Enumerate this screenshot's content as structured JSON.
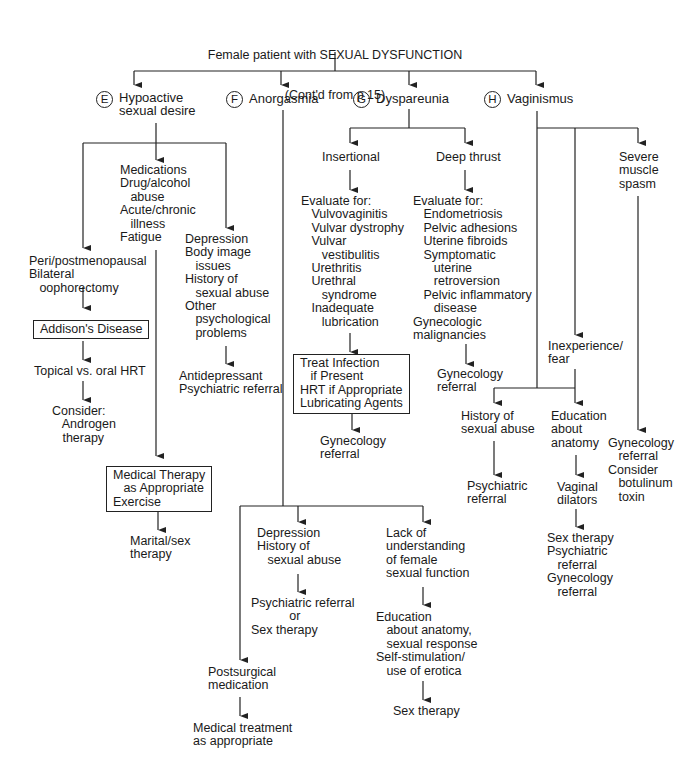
{
  "title": {
    "line1": "Female patient with SEXUAL DYSFUNCTION",
    "line2": "(Cont'd from p 15)"
  },
  "branches": {
    "E": {
      "letter": "E",
      "label": "Hypoactive\nsexual desire"
    },
    "F": {
      "letter": "F",
      "label": "Anorgasmia"
    },
    "G": {
      "letter": "G",
      "label": "Dyspareunia"
    },
    "H": {
      "letter": "H",
      "label": "Vaginismus"
    }
  },
  "hypoactive": {
    "causes_medical": "Medications\nDrug/alcohol\n   abuse\nAcute/chronic\n   illness\nFatigue",
    "causes_menopausal": "Peri/postmenopausal\nBilateral\n   oophorectomy",
    "addisons_box": "Addison's Disease",
    "hrt": "Topical vs. oral HRT",
    "consider_androgen": "Consider:\n   Androgen\n   therapy",
    "causes_psych": "Depression\nBody image\n   issues\nHistory of\n   sexual abuse\nOther\n   psychological\n   problems",
    "psych_treatment": "Antidepressant\nPsychiatric referral",
    "medical_therapy_box": "Medical Therapy\n   as Appropriate\nExercise",
    "marital_therapy": "Marital/sex\ntherapy"
  },
  "anorgasmia": {
    "depression": "Depression\nHistory of\n   sexual abuse",
    "depression_treatment": "Psychiatric referral\n           or\nSex therapy",
    "lack_understanding": "Lack of\nunderstanding\nof female\nsexual function",
    "education": "Education\n   about anatomy,\n   sexual response\nSelf-stimulation/\n   use of erotica",
    "sex_therapy": "Sex therapy",
    "postsurgical": "Postsurgical\nmedication",
    "medical_treatment": "Medical treatment\nas appropriate"
  },
  "dyspareunia": {
    "insertional": "Insertional",
    "insertional_eval": "Evaluate for:\n   Vulvovaginitis\n   Vulvar dystrophy\n   Vulvar\n      vestibulitis\n   Urethritis\n   Urethral\n      syndrome\n   Inadequate\n      lubrication",
    "treat_box": "Treat Infection\n   if Present\nHRT if Appropriate\nLubricating Agents",
    "insertional_referral": "Gynecology\nreferral",
    "deep_thrust": "Deep thrust",
    "deep_eval": "Evaluate for:\n   Endometriosis\n   Pelvic adhesions\n   Uterine fibroids\n   Symptomatic\n      uterine\n      retroversion\n   Pelvic inflammatory\n      disease\nGynecologic\nmalignancies",
    "deep_referral": "Gynecology\nreferral"
  },
  "vaginismus": {
    "inexperience": "Inexperience/\nfear",
    "history_abuse": "History of\nsexual abuse",
    "psych_referral": "Psychiatric\nreferral",
    "education_anatomy": "Education\nabout\nanatomy",
    "dilators": "Vaginal\ndilators",
    "combined_referral": "Sex therapy\nPsychiatric\n   referral\nGynecology\n   referral",
    "severe_spasm": "Severe\nmuscle\nspasm",
    "spasm_treatment": "Gynecology\n   referral\nConsider\n   botulinum\n   toxin"
  }
}
